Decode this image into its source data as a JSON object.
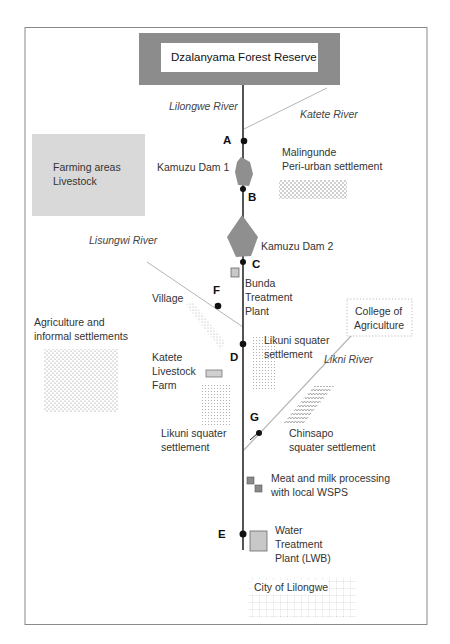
{
  "colors": {
    "frame": "#8a8a8a",
    "forest_outer": "#8c8c8c",
    "forest_inner": "#ffffff",
    "farming_fill": "#d9d9d9",
    "dam_fill": "#8f8f8f",
    "river_main": "#2a2a2a",
    "river_trib": "#b5b5b5",
    "point": "#111111",
    "plant_fill": "#c8c8c8",
    "processing_fill": "#8a8a8a",
    "pattern": "#9a9a9a"
  },
  "title": "Dzalanyama Forest Reserve",
  "rivers": {
    "lilongwe": "Lilongwe River",
    "katete": "Katete River",
    "lisungwi": "Lisungwi River",
    "likni": "Likni River"
  },
  "points": {
    "a": "A",
    "b": "B",
    "c": "C",
    "d": "D",
    "e": "E",
    "f": "F",
    "g": "G"
  },
  "areas": {
    "farming_line1": "Farming areas",
    "farming_line2": "Livestock",
    "malingunde_line1": "Malingunde",
    "malingunde_line2": "Peri-urban settlement",
    "dam1": "Kamuzu Dam 1",
    "dam2": "Kamuzu Dam 2",
    "bunda_line1": "Bunda",
    "bunda_line2": "Treatment",
    "bunda_line3": "Plant",
    "village": "Village",
    "college_line1": "College of",
    "college_line2": "Agriculture",
    "agri_line1": "Agriculture and",
    "agri_line2": "informal settlements",
    "katete_farm_line1": "Katete",
    "katete_farm_line2": "Livestock",
    "katete_farm_line3": "Farm",
    "likuni_right_line1": "Likuni squater",
    "likuni_right_line2": "settlement",
    "likuni_left_line1": "Likuni squater",
    "likuni_left_line2": "settlement",
    "chinsapo_line1": "Chinsapo",
    "chinsapo_line2": "squater settlement",
    "meat_line1": "Meat and milk processing",
    "meat_line2": "with local WSPS",
    "water_line1": "Water",
    "water_line2": "Treatment",
    "water_line3": "Plant (LWB)",
    "city": "City of Lilongwe"
  }
}
